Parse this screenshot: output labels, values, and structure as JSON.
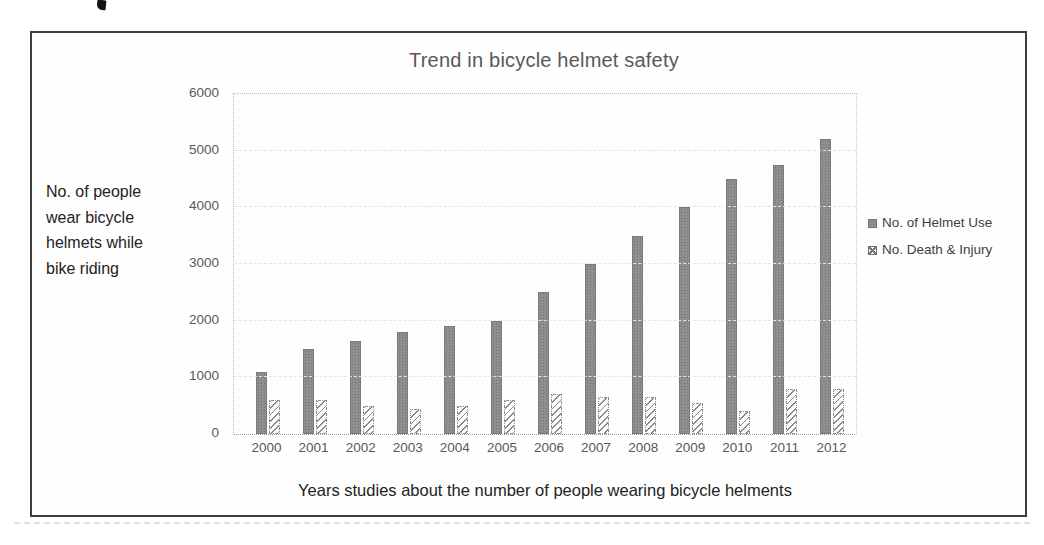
{
  "chart_data": {
    "type": "bar",
    "title": "Trend in bicycle helmet safety",
    "xlabel": "Years studies about the number of people wearing bicycle helments",
    "ylabel": "No. of people wear bicycle helmets while bike riding",
    "ylabel_lines": [
      "No. of people",
      "wear bicycle",
      "helmets while",
      "bike riding"
    ],
    "categories": [
      "2000",
      "2001",
      "2002",
      "2003",
      "2004",
      "2005",
      "2006",
      "2007",
      "2008",
      "2009",
      "2010",
      "2011",
      "2012"
    ],
    "series": [
      {
        "name": "No. of Helmet Use",
        "style": "solid-gray",
        "values": [
          1100,
          1500,
          1650,
          1800,
          1900,
          2000,
          2500,
          3000,
          3500,
          4000,
          4500,
          4750,
          5200
        ]
      },
      {
        "name": "No. Death & Injury",
        "style": "diagonal-hatch",
        "values": [
          600,
          600,
          500,
          450,
          500,
          600,
          700,
          650,
          650,
          550,
          400,
          800,
          800
        ]
      }
    ],
    "ylim": [
      0,
      6000
    ],
    "yticks": [
      0,
      1000,
      2000,
      3000,
      4000,
      5000,
      6000
    ],
    "grid": "horizontal-dashed",
    "legend_position": "right",
    "colors": {
      "bar_solid": "#8f8f8f",
      "bar_hatch_line": "#7d7d7d",
      "axis_text": "#595959",
      "title_text": "#595959",
      "label_text": "#232323",
      "gridline": "#e9e3e1",
      "frame_border": "#3d3d3d"
    }
  }
}
